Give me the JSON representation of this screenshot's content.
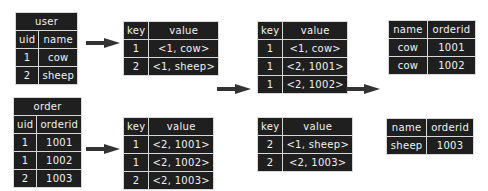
{
  "user_table": {
    "title": "user",
    "headers": [
      "uid",
      "name"
    ],
    "rows": [
      [
        "1",
        "cow"
      ],
      [
        "2",
        "sheep"
      ]
    ]
  },
  "order_table": {
    "title": "order",
    "headers": [
      "uid",
      "orderid"
    ],
    "rows": [
      [
        "1",
        "1001"
      ],
      [
        "1",
        "1002"
      ],
      [
        "2",
        "1003"
      ]
    ]
  },
  "map_user": {
    "headers": [
      "key",
      "value"
    ],
    "rows": [
      [
        "1",
        "<1, cow>"
      ],
      [
        "2",
        "<1, sheep>"
      ]
    ]
  },
  "map_order": {
    "headers": [
      "key",
      "value"
    ],
    "rows": [
      [
        "1",
        "<2, 1001>"
      ],
      [
        "1",
        "<2, 1002>"
      ],
      [
        "2",
        "<2, 1003>"
      ]
    ]
  },
  "shuffle_key1": {
    "headers": [
      "key",
      "value"
    ],
    "rows": [
      [
        "1",
        "<1, cow>"
      ],
      [
        "1",
        "<2, 1001>"
      ],
      [
        "1",
        "<2, 1002>"
      ]
    ]
  },
  "shuffle_key2": {
    "headers": [
      "key",
      "value"
    ],
    "rows": [
      [
        "2",
        "<1, sheep>"
      ],
      [
        "2",
        "<2, 1003>"
      ]
    ]
  },
  "result_key1": {
    "headers": [
      "name",
      "orderid"
    ],
    "rows": [
      [
        "cow",
        "1001"
      ],
      [
        "cow",
        "1002"
      ]
    ]
  },
  "result_key2": {
    "headers": [
      "name",
      "orderid"
    ],
    "rows": [
      [
        "sheep",
        "1003"
      ]
    ]
  },
  "arrows": [
    "map-arrow-user",
    "map-arrow-order",
    "shuffle-arrow",
    "reduce-arrow"
  ]
}
